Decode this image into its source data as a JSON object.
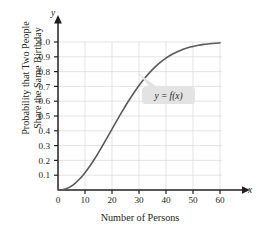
{
  "chart_data": {
    "type": "line",
    "title": "",
    "subtitle": "",
    "xlabel": "Number of Persons",
    "ylabel_line1": "Probability that Two People",
    "ylabel_line2": "Share the Same Birthday",
    "x_axis_name": "x",
    "y_axis_name": "y",
    "xlim": [
      0,
      63
    ],
    "ylim": [
      0,
      1.06
    ],
    "x_ticks": [
      0,
      10,
      20,
      30,
      40,
      50,
      60
    ],
    "x_tick_labels": [
      "0",
      "10",
      "20",
      "30",
      "40",
      "50",
      "60"
    ],
    "y_ticks": [
      0.1,
      0.2,
      0.3,
      0.4,
      0.5,
      0.6,
      0.7,
      0.8,
      0.9,
      1.0
    ],
    "y_tick_labels": [
      "0.1",
      "0.2",
      "0.3",
      "0.4",
      "0.5",
      "0.6",
      "0.7",
      "0.8",
      "0.9",
      "1.0"
    ],
    "grid": true,
    "grid_color": "#d9d9d9",
    "legend": "none",
    "curve_color": "#5a5a5a",
    "axis_color": "#231f20",
    "series": [
      {
        "name": "y = f(x)",
        "x": [
          0,
          2,
          4,
          6,
          8,
          10,
          12,
          14,
          16,
          18,
          20,
          22,
          23,
          24,
          26,
          28,
          30,
          32,
          34,
          36,
          38,
          40,
          42,
          44,
          46,
          48,
          50,
          52,
          54,
          56,
          58,
          60
        ],
        "values": [
          0.0,
          0.003,
          0.016,
          0.04,
          0.074,
          0.117,
          0.167,
          0.223,
          0.284,
          0.347,
          0.411,
          0.476,
          0.507,
          0.538,
          0.598,
          0.654,
          0.706,
          0.753,
          0.795,
          0.832,
          0.864,
          0.891,
          0.914,
          0.933,
          0.948,
          0.961,
          0.97,
          0.978,
          0.984,
          0.988,
          0.992,
          0.994
        ]
      }
    ],
    "annotations": [
      {
        "name": "curve-callout",
        "text": "y = f(x)",
        "x": 34,
        "y": 0.605,
        "points_to_x": 29,
        "points_to_y": 0.7,
        "box_fill": "#e3e3e3"
      }
    ]
  }
}
